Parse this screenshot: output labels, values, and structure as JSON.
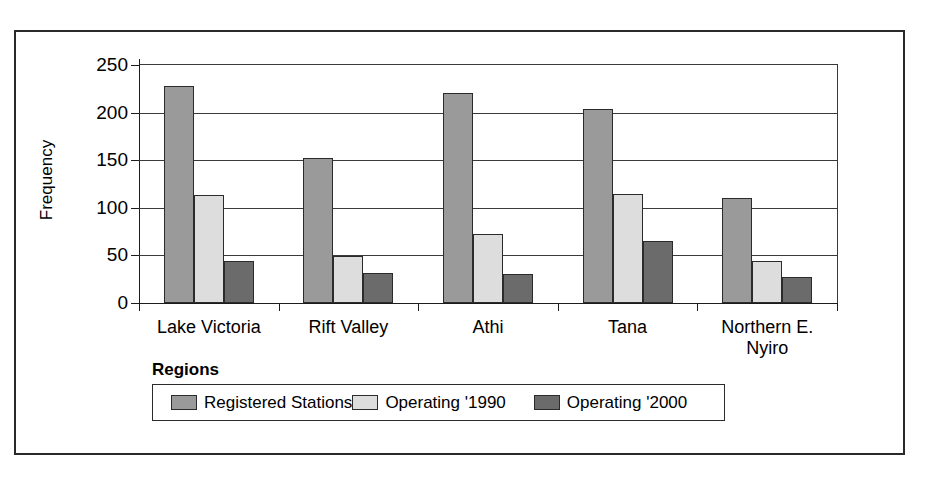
{
  "chart_data": {
    "type": "bar",
    "title": "",
    "subtitle": "",
    "xlabel": "Regions",
    "ylabel": "Frequency",
    "categories": [
      "Lake Victoria",
      "Rift Valley",
      "Athi",
      "Tana",
      "Northern E.\nNyiro"
    ],
    "series": [
      {
        "name": "Registered Stations",
        "color": "#9a9a9a",
        "values": [
          228,
          152,
          221,
          204,
          110
        ]
      },
      {
        "name": "Operating '1990",
        "color": "#dddddd",
        "values": [
          113,
          49,
          73,
          114,
          44
        ]
      },
      {
        "name": "Operating '2000",
        "color": "#6b6b6b",
        "values": [
          44,
          32,
          30,
          65,
          27
        ]
      }
    ],
    "ylim": [
      0,
      250
    ],
    "yticks": [
      0,
      50,
      100,
      150,
      200,
      250
    ],
    "ytick_labels": [
      "0",
      "50",
      "100",
      "150",
      "200",
      "250"
    ],
    "grid": "horizontal",
    "legend_position": "bottom-left",
    "bar_border_color": "#2b2b2b",
    "axis_color": "#1c1c1c",
    "gridline_color": "#3a3a3a",
    "frame_color": "#2a2a2a",
    "background": "#ffffff"
  }
}
